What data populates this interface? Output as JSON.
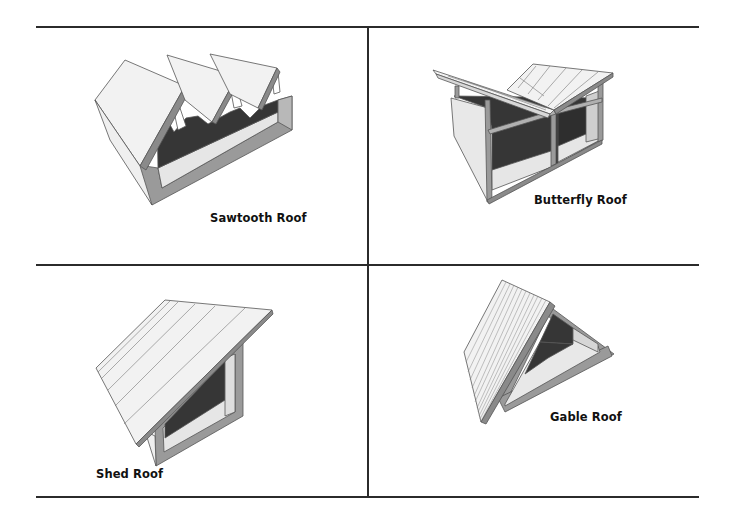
{
  "figure": {
    "layout": "2x2 grid",
    "panels": [
      {
        "id": "sawtooth",
        "label": "Sawtooth Roof",
        "position": "top-left"
      },
      {
        "id": "butterfly",
        "label": "Butterfly Roof",
        "position": "top-right"
      },
      {
        "id": "shed",
        "label": "Shed Roof",
        "position": "bottom-left"
      },
      {
        "id": "gable",
        "label": "Gable Roof",
        "position": "bottom-right"
      }
    ]
  },
  "colors": {
    "rule": "#2b2b2b",
    "roof_face": "#f2f2f2",
    "roof_edge": "#6e6e6e",
    "wall_section": "#9a9a9a",
    "wall_inner": "#e6e6e6",
    "interior_dark": "#3a3a3a",
    "outline": "#555555"
  }
}
